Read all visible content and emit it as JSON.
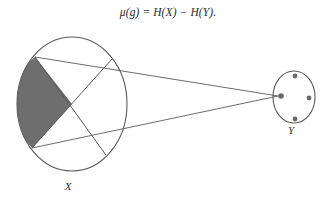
{
  "figure": {
    "caption_formula": "μ(g) = H(X) − H(Y).",
    "background_color": "#ffffff",
    "stroke_color": "#5a5a5a",
    "shaded_fill_color": "#6e6e6e",
    "dot_color": "#6a6a6a"
  },
  "domain_set": {
    "label": "X",
    "shape": "circle",
    "center": {
      "x": 72,
      "y": 104
    },
    "radius_x": 55,
    "radius_y": 67,
    "label_position": {
      "x": 68,
      "y": 190
    },
    "shaded_region_description": "shaded left wedge bounded by two chords",
    "chords": [
      {
        "name": "chord-upper",
        "from": {
          "x": 35,
          "y": 57
        },
        "to": {
          "x": 106,
          "y": 155
        }
      },
      {
        "name": "chord-lower",
        "from": {
          "x": 32,
          "y": 148
        },
        "to": {
          "x": 112,
          "y": 59
        }
      }
    ],
    "chord_intersection": {
      "x": 72,
      "y": 104
    }
  },
  "codomain_set": {
    "label": "Y",
    "shape": "ellipse",
    "center": {
      "x": 294,
      "y": 97
    },
    "radius_x": 21,
    "radius_y": 26,
    "label_position": {
      "x": 291,
      "y": 134
    },
    "elements": [
      {
        "name": "dot-top",
        "x": 295,
        "y": 76,
        "r": 2.4
      },
      {
        "name": "dot-right",
        "x": 309,
        "y": 98,
        "r": 2.4
      },
      {
        "name": "dot-bottom",
        "x": 295,
        "y": 119,
        "r": 2.4
      },
      {
        "name": "dot-left",
        "x": 281,
        "y": 96,
        "r": 2.8
      }
    ],
    "target_element": "dot-left"
  },
  "mapping_lines": [
    {
      "name": "map-line-upper",
      "from": {
        "x": 35,
        "y": 57
      },
      "to": {
        "x": 278,
        "y": 96
      }
    },
    {
      "name": "map-line-lower",
      "from": {
        "x": 32,
        "y": 148
      },
      "to": {
        "x": 278,
        "y": 96
      }
    }
  ]
}
